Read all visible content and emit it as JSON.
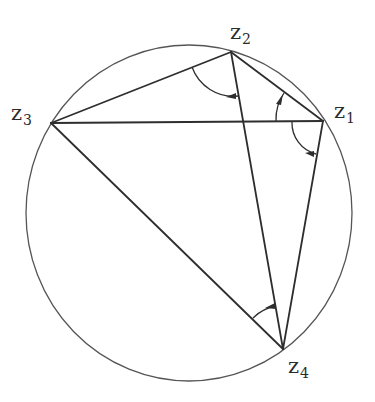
{
  "diagram": {
    "type": "cyclic-quadrilateral",
    "colors": {
      "stroke": "#3a3a3a",
      "background": "#ffffff"
    },
    "circle": {
      "cx": 189,
      "cy": 213,
      "rx": 163,
      "ry": 168
    },
    "points": [
      {
        "id": "z1",
        "name": "z",
        "sub": "1",
        "x": 323,
        "y": 121
      },
      {
        "id": "z2",
        "name": "z",
        "sub": "2",
        "x": 231,
        "y": 52
      },
      {
        "id": "z3",
        "name": "z",
        "sub": "3",
        "x": 51,
        "y": 123
      },
      {
        "id": "z4",
        "name": "z",
        "sub": "4",
        "x": 283,
        "y": 349
      }
    ],
    "segments": [
      [
        "z3",
        "z2"
      ],
      [
        "z3",
        "z1"
      ],
      [
        "z3",
        "z4"
      ],
      [
        "z2",
        "z1"
      ],
      [
        "z2",
        "z4"
      ],
      [
        "z1",
        "z4"
      ]
    ],
    "angle_marks": [
      {
        "vertex": "z2",
        "between": [
          "z3",
          "z4"
        ]
      },
      {
        "vertex": "z1",
        "between": [
          "z3",
          "z2"
        ]
      },
      {
        "vertex": "z1",
        "between": [
          "z3",
          "z4"
        ]
      },
      {
        "vertex": "z4",
        "between": [
          "z3",
          "z2"
        ]
      }
    ]
  }
}
